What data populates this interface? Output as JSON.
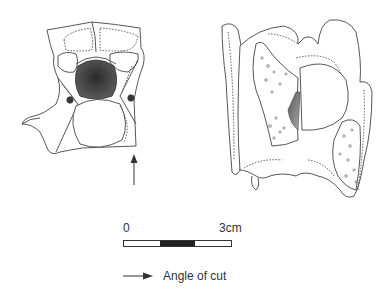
{
  "figure": {
    "left_view": {
      "subject": "vertebra-cranial-view",
      "has_cut_arrow": true
    },
    "right_view": {
      "subject": "vertebra-lateral-view-with-cut-surface"
    }
  },
  "scale": {
    "label_start": "0",
    "label_end": "3cm",
    "segments": [
      "light",
      "dark",
      "light"
    ],
    "colors": {
      "dark": "#222222",
      "light": "#ffffff",
      "outline": "#333333"
    }
  },
  "legend": {
    "icon": "right-arrow-icon",
    "label": "Angle of cut"
  }
}
